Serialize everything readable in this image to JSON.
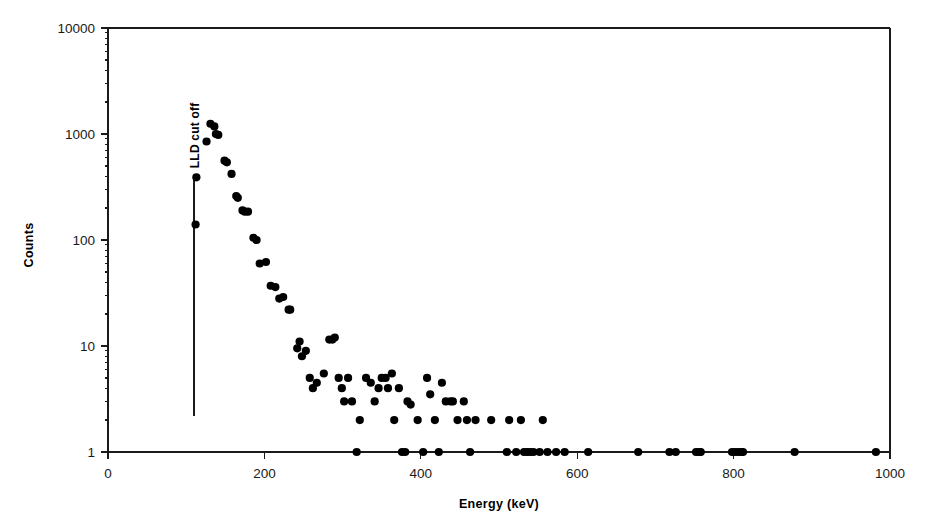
{
  "chart_data": {
    "type": "scatter",
    "title": "",
    "xlabel": "Energy (keV)",
    "ylabel": "Counts",
    "xlim": [
      0,
      1000
    ],
    "ylim": [
      1,
      10000
    ],
    "yscale": "log",
    "xscale": "linear",
    "grid": false,
    "legend": null,
    "xticks": [
      0,
      200,
      400,
      600,
      800,
      1000
    ],
    "xtick_labels": [
      "0",
      "200",
      "400",
      "600",
      "800",
      "1000"
    ],
    "yticks": [
      1,
      10,
      100,
      1000,
      10000
    ],
    "ytick_labels": [
      "1",
      "10",
      "100",
      "1000",
      "10000"
    ],
    "marker": "filled-circle",
    "marker_color": "#000000",
    "marker_size": 7,
    "annotations": [
      {
        "name": "lld-cut-off",
        "text": "LLD cut off",
        "rotation": -90,
        "line_x": 110,
        "line_y_from": 2.2,
        "line_y_to": 400
      }
    ],
    "points": [
      [
        112,
        140
      ],
      [
        113,
        390
      ],
      [
        126,
        850
      ],
      [
        131,
        1250
      ],
      [
        136,
        1180
      ],
      [
        138,
        1000
      ],
      [
        141,
        980
      ],
      [
        149,
        560
      ],
      [
        152,
        540
      ],
      [
        158,
        420
      ],
      [
        164,
        260
      ],
      [
        166,
        250
      ],
      [
        172,
        190
      ],
      [
        175,
        185
      ],
      [
        179,
        185
      ],
      [
        186,
        105
      ],
      [
        190,
        100
      ],
      [
        194,
        60
      ],
      [
        202,
        62
      ],
      [
        208,
        37
      ],
      [
        214,
        36
      ],
      [
        219,
        28
      ],
      [
        224,
        29
      ],
      [
        231,
        22
      ],
      [
        233,
        22
      ],
      [
        242,
        9.5
      ],
      [
        245,
        11
      ],
      [
        248,
        8
      ],
      [
        253,
        9
      ],
      [
        258,
        5
      ],
      [
        262,
        4
      ],
      [
        267,
        4.5
      ],
      [
        276,
        5.5
      ],
      [
        283,
        11.5
      ],
      [
        287,
        11.5
      ],
      [
        290,
        12
      ],
      [
        295,
        5
      ],
      [
        299,
        4
      ],
      [
        302,
        3
      ],
      [
        307,
        5
      ],
      [
        312,
        3
      ],
      [
        318,
        1
      ],
      [
        322,
        2
      ],
      [
        330,
        5
      ],
      [
        336,
        4.5
      ],
      [
        341,
        3
      ],
      [
        346,
        4
      ],
      [
        350,
        5
      ],
      [
        355,
        5
      ],
      [
        358,
        4
      ],
      [
        363,
        5.5
      ],
      [
        366,
        2
      ],
      [
        372,
        4
      ],
      [
        376,
        1
      ],
      [
        380,
        1
      ],
      [
        383,
        3
      ],
      [
        387,
        2.8
      ],
      [
        396,
        2
      ],
      [
        403,
        1
      ],
      [
        408,
        5
      ],
      [
        412,
        3.5
      ],
      [
        418,
        2
      ],
      [
        423,
        1
      ],
      [
        427,
        4.5
      ],
      [
        432,
        3
      ],
      [
        438,
        3
      ],
      [
        441,
        3
      ],
      [
        447,
        2
      ],
      [
        455,
        3
      ],
      [
        459,
        2
      ],
      [
        463,
        1
      ],
      [
        470,
        2
      ],
      [
        490,
        2
      ],
      [
        510,
        1
      ],
      [
        513,
        2
      ],
      [
        522,
        1
      ],
      [
        528,
        2
      ],
      [
        532,
        1
      ],
      [
        536,
        1
      ],
      [
        540,
        1
      ],
      [
        544,
        1
      ],
      [
        552,
        1
      ],
      [
        556,
        2
      ],
      [
        562,
        1
      ],
      [
        573,
        1
      ],
      [
        584,
        1
      ],
      [
        614,
        1
      ],
      [
        678,
        1
      ],
      [
        718,
        1
      ],
      [
        726,
        1
      ],
      [
        752,
        1
      ],
      [
        756,
        1
      ],
      [
        758,
        1
      ],
      [
        798,
        1
      ],
      [
        802,
        1
      ],
      [
        806,
        1
      ],
      [
        810,
        1
      ],
      [
        812,
        1
      ],
      [
        878,
        1
      ],
      [
        982,
        1
      ]
    ]
  },
  "colors": {
    "marker": "#000000",
    "axis": "#1a1a1a",
    "background": "#ffffff"
  }
}
